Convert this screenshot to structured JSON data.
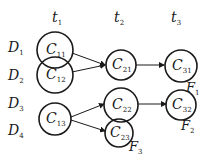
{
  "diagram": {
    "time_labels": [
      {
        "id": "t1",
        "base": "t",
        "sub": "1",
        "x": 52,
        "y": 22
      },
      {
        "id": "t2",
        "base": "t",
        "sub": "2",
        "x": 114,
        "y": 22
      },
      {
        "id": "t3",
        "base": "t",
        "sub": "3",
        "x": 171,
        "y": 22
      }
    ],
    "data_labels": [
      {
        "id": "D1",
        "base": "D",
        "sub": "1",
        "x": 8,
        "y": 52
      },
      {
        "id": "D2",
        "base": "D",
        "sub": "2",
        "x": 8,
        "y": 80
      },
      {
        "id": "D3",
        "base": "D",
        "sub": "3",
        "x": 8,
        "y": 108
      },
      {
        "id": "D4",
        "base": "D",
        "sub": "4",
        "x": 8,
        "y": 135
      }
    ],
    "clusters": [
      {
        "id": "C11",
        "base": "C",
        "sub": "11",
        "cx": 55,
        "cy": 50,
        "r": 18
      },
      {
        "id": "C12",
        "base": "C",
        "sub": "12",
        "cx": 55,
        "cy": 75,
        "r": 18
      },
      {
        "id": "C13",
        "base": "C",
        "sub": "13",
        "cx": 55,
        "cy": 119,
        "r": 16
      },
      {
        "id": "C21",
        "base": "C",
        "sub": "21",
        "cx": 121,
        "cy": 65,
        "r": 15
      },
      {
        "id": "C22",
        "base": "C",
        "sub": "22",
        "cx": 121,
        "cy": 105,
        "r": 17
      },
      {
        "id": "C23",
        "base": "C",
        "sub": "23",
        "cx": 119,
        "cy": 133,
        "r": 14
      },
      {
        "id": "C31",
        "base": "C",
        "sub": "31",
        "cx": 181,
        "cy": 66,
        "r": 16
      },
      {
        "id": "C32",
        "base": "C",
        "sub": "32",
        "cx": 181,
        "cy": 105,
        "r": 15
      }
    ],
    "edges": [
      {
        "from": "C11",
        "to": "C21",
        "x1": 72,
        "y1": 53,
        "x2": 105,
        "y2": 65
      },
      {
        "from": "C12",
        "to": "C21",
        "x1": 72,
        "y1": 72,
        "x2": 105,
        "y2": 65
      },
      {
        "from": "C21",
        "to": "C31",
        "x1": 136,
        "y1": 65,
        "x2": 164,
        "y2": 65
      },
      {
        "from": "C13",
        "to": "C22",
        "x1": 71,
        "y1": 117,
        "x2": 104,
        "y2": 104
      },
      {
        "from": "C13",
        "to": "C23",
        "x1": 71,
        "y1": 120,
        "x2": 105,
        "y2": 131
      },
      {
        "from": "C22",
        "to": "C32",
        "x1": 138,
        "y1": 104,
        "x2": 166,
        "y2": 104
      }
    ],
    "final_labels": [
      {
        "id": "F1",
        "base": "F",
        "sub": "1",
        "x": 186,
        "y": 92
      },
      {
        "id": "F2",
        "base": "F",
        "sub": "2",
        "x": 181,
        "y": 130
      },
      {
        "id": "F3",
        "base": "F",
        "sub": "3",
        "x": 129,
        "y": 151
      }
    ],
    "colors": {
      "stroke": "#1a1a1a",
      "background": "#ffffff"
    }
  }
}
